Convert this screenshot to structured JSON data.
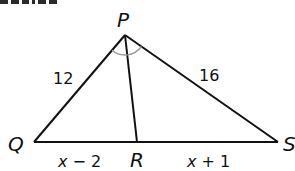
{
  "figure": {
    "type": "triangle-angle-bisector",
    "colors": {
      "stroke": "#111111",
      "angle_arc": "#9a9a9a",
      "background": "#ffffff"
    },
    "vertices": {
      "P": {
        "label": "P",
        "x": 125,
        "y": 35
      },
      "Q": {
        "label": "Q",
        "x": 34,
        "y": 142
      },
      "R": {
        "label": "R",
        "x": 137,
        "y": 142
      },
      "S": {
        "label": "S",
        "x": 278,
        "y": 142
      }
    },
    "segments": {
      "PQ": {
        "label": "12"
      },
      "PS": {
        "label": "16"
      },
      "QR": {
        "label_var": "x",
        "label_rest": " − 2"
      },
      "RS": {
        "label_var": "x",
        "label_rest": " + 1"
      }
    },
    "angle_marks": {
      "description": "angle QPR congruent to angle RPS (PR bisects angle P)",
      "count": 2
    }
  }
}
